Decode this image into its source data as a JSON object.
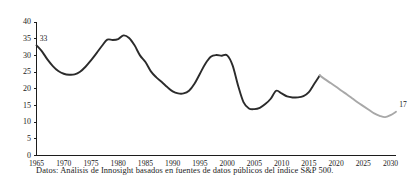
{
  "chart_data": {
    "type": "line",
    "title": "",
    "subtitle": "",
    "xlabel": "",
    "ylabel": "",
    "xlim": [
      1965,
      2031
    ],
    "ylim": [
      0,
      40
    ],
    "grid": false,
    "legend_position": "none",
    "y_ticks": [
      0,
      5,
      10,
      15,
      20,
      25,
      30,
      35,
      40
    ],
    "y_tick_labels": [
      "0",
      "5",
      "10",
      "15",
      "20",
      "25",
      "30",
      "35",
      "40"
    ],
    "x_ticks": [
      1965,
      1970,
      1975,
      1980,
      1985,
      1990,
      1995,
      2000,
      2005,
      2010,
      2015,
      2020,
      2025,
      2030
    ],
    "x_tick_labels": [
      "1965",
      "1970",
      "1975",
      "1980",
      "1985",
      "1990",
      "1995",
      "2000",
      "2005",
      "2010",
      "2015",
      "2020",
      "2025",
      "2030"
    ],
    "series": [
      {
        "name": "historic",
        "style": "solid",
        "color": "#2b2b2b",
        "x": [
          1965,
          1966,
          1967,
          1968,
          1969,
          1970,
          1971,
          1972,
          1973,
          1974,
          1975,
          1976,
          1977,
          1978,
          1979,
          1980,
          1981,
          1982,
          1983,
          1984,
          1985,
          1986,
          1987,
          1988,
          1989,
          1990,
          1991,
          1992,
          1993,
          1994,
          1995,
          1996,
          1997,
          1998,
          1999,
          2000,
          2001,
          2002,
          2003,
          2004,
          2005,
          2006,
          2007,
          2008,
          2009,
          2010,
          2011,
          2012,
          2013,
          2014,
          2015,
          2016,
          2017
        ],
        "y": [
          33,
          31.2,
          28.8,
          26.8,
          25.3,
          24.5,
          24.2,
          24.3,
          25.1,
          26.6,
          28.5,
          30.6,
          32.8,
          34.7,
          34.6,
          34.9,
          36.0,
          35.2,
          33.0,
          30.0,
          28.0,
          25.2,
          23.4,
          22.0,
          20.5,
          19.2,
          18.6,
          18.6,
          19.4,
          21.5,
          24.5,
          27.5,
          29.6,
          30.1,
          29.9,
          30.0,
          27.0,
          21.0,
          16.0,
          14.1,
          13.9,
          14.3,
          15.4,
          17.0,
          19.4,
          18.6,
          17.7,
          17.4,
          17.4,
          17.8,
          19.0,
          21.5,
          24.0
        ]
      },
      {
        "name": "forecast",
        "style": "solid",
        "color": "#a8a8a8",
        "x": [
          2017,
          2018,
          2019,
          2020,
          2021,
          2022,
          2023,
          2024,
          2025,
          2026,
          2027,
          2028,
          2029,
          2030,
          2031
        ],
        "y": [
          24.0,
          22.8,
          21.7,
          20.6,
          19.4,
          18.3,
          17.1,
          15.9,
          14.8,
          13.7,
          12.6,
          11.9,
          11.5,
          12.1,
          13.1
        ]
      }
    ],
    "annotations": [
      {
        "label": "33",
        "x": 1965,
        "y": 33,
        "position": "above-right"
      },
      {
        "label": "17",
        "x": 2031,
        "y": 13.1,
        "position": "above-right"
      }
    ],
    "caption": "Datos: Análisis de Innosight basados en fuentes de datos públicos del índice S&P 500."
  }
}
